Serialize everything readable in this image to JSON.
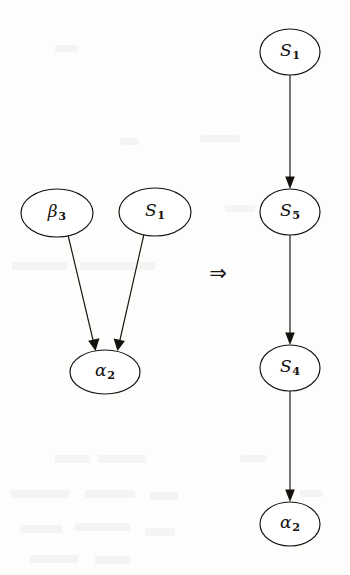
{
  "figure": {
    "caption": "",
    "background_color": "#fdfdfc",
    "ink_color": "#14110e",
    "separator_symbol": "⇒",
    "separator_name": "double-right-arrow"
  },
  "graph_data": {
    "type": "diagram",
    "title": "",
    "description": "Graph rewriting rule: a two-parent convergence pattern on the left is transformed into a linear chain on the right.",
    "panels": [
      {
        "id": "lhs",
        "name": "left-hand-side-graph",
        "nodes": [
          {
            "id": "lhs-beta3",
            "base": "β",
            "sub": "3",
            "label": "β3",
            "cx": 57,
            "cy": 213,
            "rx": 36,
            "ry": 24
          },
          {
            "id": "lhs-s1",
            "base": "S",
            "sub": "1",
            "label": "S1",
            "cx": 155,
            "cy": 212,
            "rx": 36,
            "ry": 24
          },
          {
            "id": "lhs-alpha2",
            "base": "α",
            "sub": "2",
            "label": "α2",
            "cx": 105,
            "cy": 372,
            "rx": 35,
            "ry": 22
          }
        ],
        "edges": [
          {
            "id": "lhs-edge-beta3-alpha2",
            "from": "lhs-beta3",
            "to": "lhs-alpha2",
            "directed": true
          },
          {
            "id": "lhs-edge-s1-alpha2",
            "from": "lhs-s1",
            "to": "lhs-alpha2",
            "directed": true
          }
        ]
      },
      {
        "id": "rhs",
        "name": "right-hand-side-graph",
        "nodes": [
          {
            "id": "rhs-s1",
            "base": "S",
            "sub": "1",
            "label": "S1",
            "cx": 290,
            "cy": 52,
            "rx": 30,
            "ry": 23
          },
          {
            "id": "rhs-s5",
            "base": "S",
            "sub": "5",
            "label": "S5",
            "cx": 290,
            "cy": 212,
            "rx": 30,
            "ry": 23
          },
          {
            "id": "rhs-s4",
            "base": "S",
            "sub": "4",
            "label": "S4",
            "cx": 290,
            "cy": 368,
            "rx": 30,
            "ry": 23
          },
          {
            "id": "rhs-alpha2",
            "base": "α",
            "sub": "2",
            "label": "α2",
            "cx": 290,
            "cy": 524,
            "rx": 30,
            "ry": 22
          }
        ],
        "edges": [
          {
            "id": "rhs-edge-s1-s5",
            "from": "rhs-s1",
            "to": "rhs-s5",
            "directed": true
          },
          {
            "id": "rhs-edge-s5-s4",
            "from": "rhs-s5",
            "to": "rhs-s4",
            "directed": true
          },
          {
            "id": "rhs-edge-s4-alpha2",
            "from": "rhs-s4",
            "to": "rhs-alpha2",
            "directed": true
          }
        ]
      }
    ],
    "separator": {
      "symbol": "⇒",
      "x": 218,
      "y": 273
    }
  }
}
